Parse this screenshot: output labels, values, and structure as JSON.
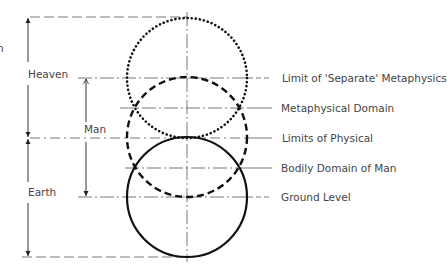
{
  "diagram": {
    "left_edge_fragment": "n",
    "side_labels": {
      "heaven": "Heaven",
      "man": "Man",
      "earth": "Earth"
    },
    "right_labels": [
      {
        "id": "limit-separate-metaphysics",
        "text": "Limit of 'Separate' Metaphysics",
        "line_style": "dashed"
      },
      {
        "id": "metaphysical-domain",
        "text": "Metaphysical Domain",
        "line_style": "solid"
      },
      {
        "id": "limits-of-physical",
        "text": "Limits of Physical",
        "line_style": "solid"
      },
      {
        "id": "bodily-domain-of-man",
        "text": "Bodily Domain of Man",
        "line_style": "solid"
      },
      {
        "id": "ground-level",
        "text": "Ground Level",
        "line_style": "dashed"
      }
    ],
    "circles": [
      {
        "id": "upper-circle",
        "style": "dotted",
        "meaning": "metaphysical / heaven"
      },
      {
        "id": "middle-circle",
        "style": "dashed",
        "meaning": "man"
      },
      {
        "id": "lower-circle",
        "style": "solid",
        "meaning": "earth / physical"
      }
    ],
    "colors": {
      "ink": "#111111",
      "thin_line": "#555555",
      "text": "#444444",
      "background": "#ffffff"
    }
  }
}
